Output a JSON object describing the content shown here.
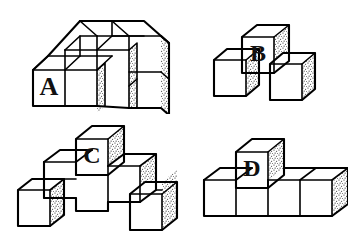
{
  "page": {
    "background_color": "#ffffff",
    "line_color": "#000000",
    "face_fill": "#ffffff",
    "shaded_face_pattern": "stipple-dots",
    "width": 356,
    "height": 247,
    "style": "black-and-white isometric line drawing"
  },
  "figures": [
    {
      "id": "figure-a",
      "label": "A",
      "label_face": "front",
      "cube_count": 8,
      "description": "Two-level L-shaped stack: a 2x2 block of cubes on the lower level with an upper tier stepping back",
      "position": {
        "x": 28,
        "y": 14,
        "width": 140,
        "height": 98
      }
    },
    {
      "id": "figure-b",
      "label": "B",
      "label_face": "front",
      "cube_count": 3,
      "description": "One cube labeled B resting on top between two lower cubes",
      "position": {
        "x": 212,
        "y": 22,
        "width": 108,
        "height": 86
      }
    },
    {
      "id": "figure-c",
      "label": "C",
      "label_face": "front",
      "cube_count": 8,
      "description": "Stepped pyramid: one top cube labeled C, a middle row, and outer lower cubes on each side",
      "position": {
        "x": 14,
        "y": 122,
        "width": 176,
        "height": 112
      }
    },
    {
      "id": "figure-d",
      "label": "D",
      "label_face": "front",
      "cube_count": 5,
      "description": "Row of four cubes with a single cube labeled D on top of the second cube",
      "position": {
        "x": 198,
        "y": 134,
        "width": 146,
        "height": 96
      }
    }
  ],
  "labels": {
    "a": "A",
    "b": "B",
    "c": "C",
    "d": "D"
  }
}
